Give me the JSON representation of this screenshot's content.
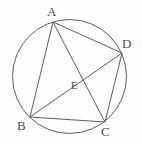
{
  "figure": {
    "kind": "circle-geometry-diagram",
    "background_color": "#fefefe",
    "stroke_color": "#5d5d5d",
    "label_color": "#4a4a4a",
    "circle": {
      "name": "circumcircle",
      "cx": 69.5,
      "cy": 76.5,
      "r": 57,
      "stroke_width": 1
    },
    "points": [
      {
        "id": "A",
        "label": "A",
        "x": 53,
        "y": 22,
        "label_x": 47,
        "label_y": 5
      },
      {
        "id": "B",
        "label": "B",
        "x": 30,
        "y": 117,
        "label_x": 17,
        "label_y": 119
      },
      {
        "id": "C",
        "label": "C",
        "x": 105,
        "y": 122,
        "label_x": 101,
        "label_y": 125
      },
      {
        "id": "D",
        "label": "D",
        "x": 122,
        "y": 53,
        "label_x": 122,
        "label_y": 37
      },
      {
        "id": "E",
        "label": "E",
        "x": 77,
        "y": 81,
        "label_x": 71,
        "label_y": 80
      }
    ],
    "segments": [
      {
        "name": "segment-AB",
        "from": "A",
        "to": "B",
        "x1": 53,
        "y1": 22,
        "x2": 30,
        "y2": 117
      },
      {
        "name": "segment-AD",
        "from": "A",
        "to": "D",
        "x1": 53,
        "y1": 22,
        "x2": 122,
        "y2": 53
      },
      {
        "name": "segment-AC",
        "from": "A",
        "to": "C",
        "x1": 53,
        "y1": 22,
        "x2": 105,
        "y2": 122
      },
      {
        "name": "segment-BD",
        "from": "B",
        "to": "D",
        "x1": 30,
        "y1": 117,
        "x2": 122,
        "y2": 53
      },
      {
        "name": "segment-BC",
        "from": "B",
        "to": "C",
        "x1": 30,
        "y1": 117,
        "x2": 105,
        "y2": 122
      },
      {
        "name": "segment-DC",
        "from": "D",
        "to": "C",
        "x1": 122,
        "y1": 53,
        "x2": 105,
        "y2": 122
      }
    ],
    "labels": {
      "a": "A",
      "b": "B",
      "c": "C",
      "d": "D",
      "e": "E"
    }
  }
}
